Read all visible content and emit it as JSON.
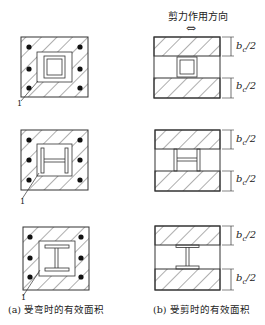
{
  "title": "剪力作用方向",
  "arrow": "⇔",
  "captions": {
    "left": "(a) 受弯时的有效面积",
    "right": "(b) 受剪时的有效面积"
  },
  "dimension_label": {
    "base": "b",
    "sub": "c",
    "tail": "/2"
  },
  "marker_label": "1",
  "rows": [
    {
      "section": "box-steel"
    },
    {
      "section": "h-steel-horizontal-web"
    },
    {
      "section": "i-steel-vertical-web"
    }
  ]
}
